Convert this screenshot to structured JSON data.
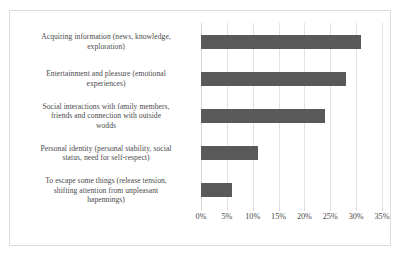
{
  "chart_data": {
    "type": "bar",
    "orientation": "horizontal",
    "title": "",
    "subtitle": "",
    "xlabel": "",
    "ylabel": "",
    "categories": [
      "Acquiring information (news, knowledge, exploration)",
      "Entertainment and pleasure (emotional experiences)",
      "Social interactions with family members, friends and connection with outside wodds",
      "Personal identity (personal stability, social status, need for self-respect)",
      "To escape some things (release tension, shifting attention from unpleasant hapennings)"
    ],
    "category_lines": [
      [
        "Acquiring information (news, knowledge,",
        "exploration)"
      ],
      [
        "Entertainment and pleasure (emotional",
        "experiences)"
      ],
      [
        "Social interactions with family members,",
        "friends and connection with outside",
        "wodds"
      ],
      [
        "Personal identity (personal stability, social",
        "status, need for self-respect)"
      ],
      [
        "To escape some things (release tension,",
        "shifting attention from unpleasant",
        "hapennings)"
      ]
    ],
    "values": [
      31,
      28,
      24,
      11,
      6
    ],
    "xlim": [
      0,
      35
    ],
    "xtick_values": [
      0,
      5,
      10,
      15,
      20,
      25,
      30,
      35
    ],
    "xtick_labels": [
      "0%",
      "5%",
      "10%",
      "15%",
      "20%",
      "25%",
      "30%",
      "35%"
    ],
    "grid": true,
    "legend": false,
    "legend_position": "none",
    "bar_color": "#595959",
    "gridline_color": "#e2e2e2",
    "border_color": "#dcdcdc",
    "text_color": "#4a4a4a",
    "background_color": "#ffffff"
  }
}
